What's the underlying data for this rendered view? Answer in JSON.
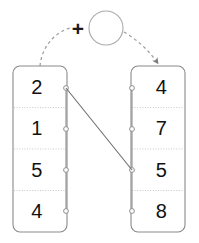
{
  "diagram": {
    "type": "two-column-mapping-diagram",
    "background_color": "#ffffff",
    "operator": {
      "symbol": "+",
      "name": "plus-operator",
      "cx": 78,
      "cy": 28
    },
    "operand_circle": {
      "label": "",
      "name": "empty-circle-node",
      "cx": 106,
      "cy": 28,
      "r": 17,
      "stroke_color": "#aaaaaa"
    },
    "left_list": {
      "name": "left-value-list",
      "x": 13,
      "y": 66,
      "width": 54,
      "height": 166,
      "stroke_color": "#8a8a8a",
      "items": [
        {
          "value": "2",
          "port_y": 88
        },
        {
          "value": "1",
          "port_y": 129
        },
        {
          "value": "5",
          "port_y": 170
        },
        {
          "value": "4",
          "port_y": 211
        }
      ]
    },
    "right_list": {
      "name": "right-value-list",
      "x": 131,
      "y": 66,
      "width": 54,
      "height": 166,
      "stroke_color": "#8a8a8a",
      "items": [
        {
          "value": "4",
          "port_y": 88
        },
        {
          "value": "7",
          "port_y": 129
        },
        {
          "value": "5",
          "port_y": 170
        },
        {
          "value": "8",
          "port_y": 211
        }
      ]
    },
    "connections": [
      {
        "name": "mapping-line-left1-right3",
        "from_list": "left",
        "from_index": 0,
        "from_value": "2",
        "to_list": "right",
        "to_index": 2,
        "to_value": "5",
        "x1": 66,
        "y1": 88,
        "x2": 132,
        "y2": 170,
        "stroke_color": "#6e6e6e"
      }
    ],
    "flow_arcs": [
      {
        "name": "dashed-arc-left-to-operator",
        "path": "M 40 66 C 42 44 58 31 70 28",
        "arrowhead": false,
        "stroke_color": "#9a9a9a"
      },
      {
        "name": "dashed-arc-operator-to-right",
        "path": "M 124 32 C 138 40 150 52 157 62",
        "arrowhead": true,
        "stroke_color": "#9a9a9a"
      }
    ]
  }
}
